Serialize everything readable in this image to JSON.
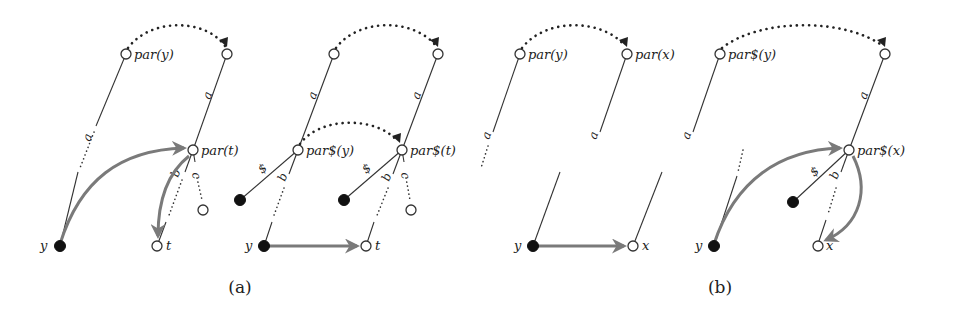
{
  "figure": {
    "panels": [
      {
        "id": "a",
        "caption": "(a)",
        "subfigures": [
          {
            "nodes": {
              "par_y": "par(y)",
              "par_t": "par(t)",
              "y": "y",
              "t": "t"
            },
            "edge_labels": {
              "a_left": "a",
              "a_right": "a",
              "b": "b",
              "c": "c"
            }
          },
          {
            "nodes": {
              "par_dollar_y": "par$(y)",
              "par_dollar_t": "par$(t)",
              "y": "y",
              "t": "t"
            },
            "edge_labels": {
              "a_left": "a",
              "a_right": "a",
              "dollar_left": "$",
              "dollar_right": "$",
              "b_left": "b",
              "b_right": "b",
              "c": "c"
            }
          }
        ]
      },
      {
        "id": "b",
        "caption": "(b)",
        "subfigures": [
          {
            "nodes": {
              "par_y": "par(y)",
              "par_x": "par(x)",
              "y": "y",
              "x": "x"
            },
            "edge_labels": {
              "a_left": "a",
              "a_right": "a"
            }
          },
          {
            "nodes": {
              "par_dollar_y": "par$(y)",
              "par_dollar_x": "par$(x)",
              "y": "y",
              "x": "x"
            },
            "edge_labels": {
              "a_left": "a",
              "a_right": "a",
              "dollar": "$",
              "b": "b"
            }
          }
        ]
      }
    ],
    "colors": {
      "tree_edge": "#333333",
      "jump_arrow": "#7a7a7a",
      "filled_node": "#111111",
      "open_node": "#ffffff"
    }
  }
}
